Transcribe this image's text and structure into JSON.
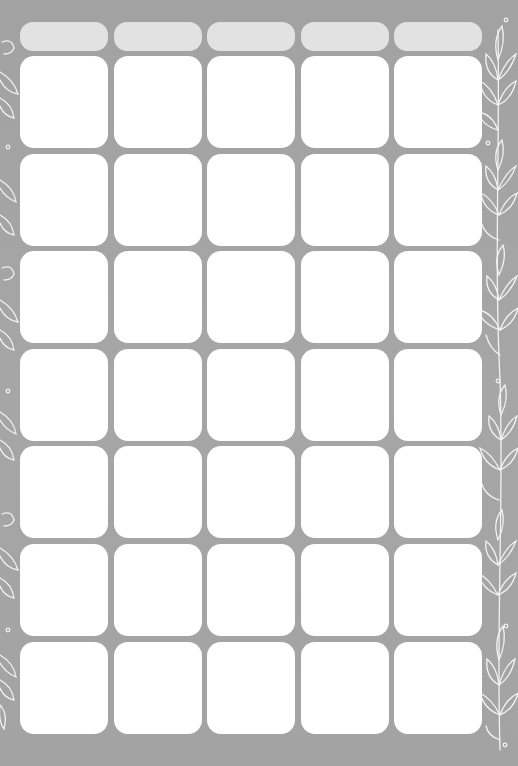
{
  "calendar": {
    "columns": 5,
    "rows": 7,
    "header_labels": [
      "",
      "",
      "",
      "",
      ""
    ],
    "cells": [
      [
        "",
        "",
        "",
        "",
        ""
      ],
      [
        "",
        "",
        "",
        "",
        ""
      ],
      [
        "",
        "",
        "",
        "",
        ""
      ],
      [
        "",
        "",
        "",
        "",
        ""
      ],
      [
        "",
        "",
        "",
        "",
        ""
      ],
      [
        "",
        "",
        "",
        "",
        ""
      ],
      [
        "",
        "",
        "",
        "",
        ""
      ]
    ]
  },
  "colors": {
    "background": "#a4a4a4",
    "header_fill": "#e2e2e2",
    "cell_fill": "#ffffff",
    "decoration": "#f2f2f2"
  },
  "decorations": {
    "left": "leaf-vine-border-icon",
    "right": "leaf-vine-border-icon"
  }
}
